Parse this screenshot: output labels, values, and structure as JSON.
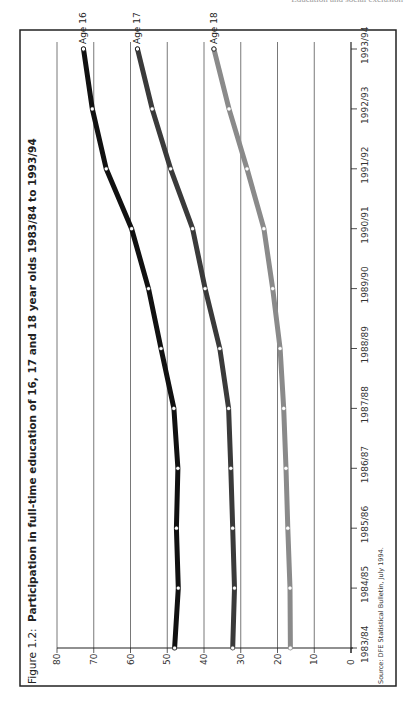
{
  "page": {
    "running_head": "Education and social exclusion"
  },
  "figure": {
    "label": "Figure 1.2:",
    "title": "Participation in full-time education of 16, 17 and 18 year olds 1983/84 to 1993/94",
    "source": "Source: DFE Statistical Bulletin, July 1994."
  },
  "chart_data": {
    "type": "line",
    "title": "Participation in full-time education of 16, 17 and 18 year olds 1983/84 to 1993/94",
    "xlabel": "",
    "ylabel": "",
    "categories": [
      "1983/84",
      "1984/85",
      "1985/86",
      "1986/87",
      "1987/88",
      "1988/89",
      "1989/90",
      "1990/91",
      "1991/92",
      "1992/93",
      "1993/94"
    ],
    "yticks": [
      0,
      10,
      20,
      30,
      40,
      50,
      60,
      70,
      80
    ],
    "ylim": [
      0,
      80
    ],
    "grid": true,
    "orientation": "rotated 90 degrees counter-clockwise on page",
    "series": [
      {
        "name": "Age 16",
        "color": "#111111",
        "values": [
          48.0,
          47.0,
          47.5,
          47.1,
          48.2,
          51.7,
          55.1,
          59.7,
          66.6,
          70.4,
          72.8
        ]
      },
      {
        "name": "Age 17",
        "color": "#3a3a3a",
        "values": [
          32.2,
          31.7,
          32.2,
          32.7,
          33.3,
          35.7,
          39.7,
          43.1,
          49.1,
          54.1,
          58.1
        ]
      },
      {
        "name": "Age 18",
        "color": "#8a8a8a",
        "values": [
          16.5,
          16.6,
          17.2,
          17.7,
          18.3,
          19.3,
          21.3,
          23.7,
          28.3,
          33.2,
          37.3
        ]
      }
    ],
    "source": "Source: DFE Statistical Bulletin, July 1994."
  }
}
